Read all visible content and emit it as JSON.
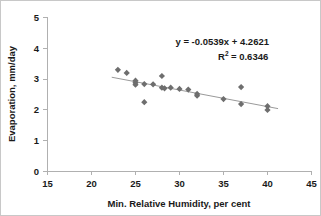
{
  "chart_data": {
    "type": "scatter",
    "title": "",
    "xlabel": "Min. Relative Humidity, per cent",
    "ylabel": "Evaporation, mm/day",
    "xlim": [
      15,
      45
    ],
    "ylim": [
      0,
      5
    ],
    "xticks": [
      15,
      20,
      25,
      30,
      35,
      40,
      45
    ],
    "yticks": [
      0,
      1,
      2,
      3,
      4,
      5
    ],
    "grid": false,
    "legend": null,
    "marker_shape": "diamond",
    "marker_color": "#6e6e6e",
    "trendline_color": "#9a9a9a",
    "points": [
      {
        "x": 23.0,
        "y": 3.3
      },
      {
        "x": 24.0,
        "y": 3.2
      },
      {
        "x": 25.0,
        "y": 2.95
      },
      {
        "x": 25.0,
        "y": 2.88
      },
      {
        "x": 25.0,
        "y": 2.82
      },
      {
        "x": 26.0,
        "y": 2.84
      },
      {
        "x": 26.0,
        "y": 2.25
      },
      {
        "x": 27.0,
        "y": 2.83
      },
      {
        "x": 28.0,
        "y": 3.1
      },
      {
        "x": 28.0,
        "y": 2.72
      },
      {
        "x": 28.3,
        "y": 2.7
      },
      {
        "x": 29.0,
        "y": 2.72
      },
      {
        "x": 30.0,
        "y": 2.68
      },
      {
        "x": 31.0,
        "y": 2.66
      },
      {
        "x": 32.0,
        "y": 2.52
      },
      {
        "x": 32.0,
        "y": 2.46
      },
      {
        "x": 35.0,
        "y": 2.35
      },
      {
        "x": 37.0,
        "y": 2.74
      },
      {
        "x": 37.0,
        "y": 2.19
      },
      {
        "x": 40.0,
        "y": 2.12
      },
      {
        "x": 40.0,
        "y": 2.0
      }
    ],
    "trendline": {
      "slope": -0.0539,
      "intercept": 4.2621,
      "x_start": 22.3,
      "x_end": 41.2
    },
    "annotations": {
      "equation": "y = -0.0539x + 4.2621",
      "r_squared_prefix": "R",
      "r_squared_sup": "2",
      "r_squared_value": "= 0.6346"
    }
  }
}
